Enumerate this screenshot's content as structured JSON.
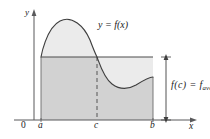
{
  "figure": {
    "axes": {
      "y_label": "y",
      "x_label": "x",
      "origin_label": "0"
    },
    "tick_labels": {
      "a": "a",
      "c": "c",
      "b": "b"
    },
    "annotations": {
      "curve_label": "y = f(x)",
      "average_value_prefix": "f(c) = f",
      "average_value_subscript": "ave"
    },
    "colors": {
      "curve_stroke": "#404040",
      "axis_stroke": "#59595b",
      "region_under_average": "#d2d2d2",
      "region_between_curve_and_average": "#ebebeb",
      "text": "#1a1a1a",
      "background": "#ffffff"
    },
    "geometry": {
      "a_x": 41,
      "c_x": 97,
      "b_x": 153,
      "baseline_y": 120,
      "average_line_y": 57,
      "curve_peak": [
        72,
        24
      ],
      "curve_min": [
        130,
        88
      ],
      "arrow_x": 166
    }
  }
}
